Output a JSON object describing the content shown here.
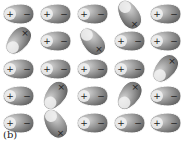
{
  "figure": {
    "label": "(b)",
    "colors": {
      "body_dark": "#5a5a5a",
      "body_light": "#d8d8d8",
      "outline": "#ffffff",
      "sign": "#222222",
      "background": "#ffffff"
    },
    "symbols": {
      "plus": "+",
      "minus": "−",
      "cross": "×"
    },
    "rows": [
      [
        {
          "orientation": "horizontal",
          "angle": 0
        },
        {
          "orientation": "horizontal",
          "angle": 0
        },
        {
          "orientation": "horizontal",
          "angle": 0
        },
        {
          "orientation": "tilted",
          "angle": 60
        },
        {
          "orientation": "horizontal",
          "angle": 0
        }
      ],
      [
        {
          "orientation": "tilted",
          "angle": -50
        },
        {
          "orientation": "horizontal",
          "angle": 0
        },
        {
          "orientation": "tilted",
          "angle": 50
        },
        {
          "orientation": "horizontal",
          "angle": 0
        },
        {
          "orientation": "horizontal",
          "angle": 0
        }
      ],
      [
        {
          "orientation": "horizontal",
          "angle": 0
        },
        {
          "orientation": "horizontal",
          "angle": 0
        },
        {
          "orientation": "horizontal",
          "angle": 0
        },
        {
          "orientation": "horizontal",
          "angle": 0
        },
        {
          "orientation": "tilted",
          "angle": -50
        }
      ],
      [
        {
          "orientation": "horizontal",
          "angle": 0
        },
        {
          "orientation": "tilted",
          "angle": -55
        },
        {
          "orientation": "horizontal",
          "angle": 0
        },
        {
          "orientation": "tilted",
          "angle": -55
        },
        {
          "orientation": "horizontal",
          "angle": 0
        }
      ],
      [
        {
          "orientation": "horizontal",
          "angle": 0
        },
        {
          "orientation": "tilted",
          "angle": 60
        },
        {
          "orientation": "horizontal",
          "angle": 0
        },
        {
          "orientation": "horizontal",
          "angle": 0
        },
        {
          "orientation": "horizontal",
          "angle": 0
        }
      ]
    ]
  }
}
